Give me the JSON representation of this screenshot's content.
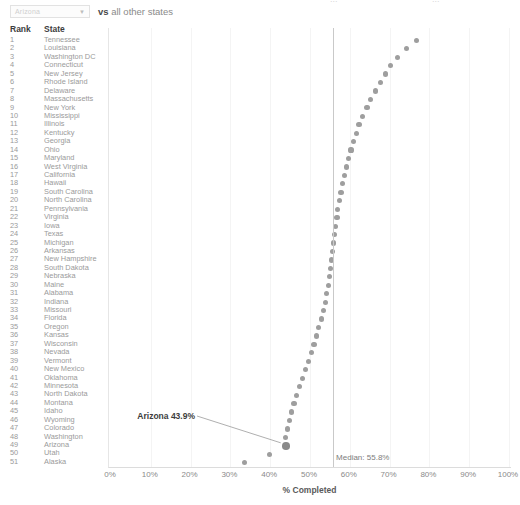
{
  "top_clipped_fragments": [
    "...",
    "..."
  ],
  "controls": {
    "state_select": {
      "value": "Arizona",
      "caret_icon": "chevron-down-icon"
    },
    "vs_prefix": "vs",
    "vs_suffix": "all other states"
  },
  "table": {
    "headers": {
      "rank": "Rank",
      "state": "State"
    }
  },
  "annotation": {
    "label": "Arizona 43.9%"
  },
  "median": {
    "label": "Median: 55.8%",
    "value": 55.8
  },
  "colors": {
    "dot": "#9e9e9e",
    "dot_highlight": "#8a8a8a",
    "median_line": "#c9c9c9",
    "gridline": "#f4f4f4",
    "text": "#9a9a9a",
    "header_text": "#3d3d3d"
  },
  "chart_data": {
    "type": "scatter",
    "title": "",
    "xlabel": "% Completed",
    "ylabel": "",
    "xlim": [
      0,
      100
    ],
    "xticks": [
      0,
      10,
      20,
      30,
      40,
      50,
      60,
      70,
      80,
      90,
      100
    ],
    "xticklabels": [
      "0%",
      "10%",
      "20%",
      "30%",
      "40%",
      "50%",
      "60%",
      "70%",
      "80%",
      "90%",
      "100%"
    ],
    "grid": true,
    "legend": null,
    "median": 55.8,
    "median_label": "Median: 55.8%",
    "highlight": "Arizona",
    "highlight_label": "Arizona 43.9%",
    "categories": [
      "Tennessee",
      "Louisiana",
      "Washington DC",
      "Connecticut",
      "New Jersey",
      "Rhode Island",
      "Delaware",
      "Massachusetts",
      "New York",
      "Mississippi",
      "Illinois",
      "Kentucky",
      "Georgia",
      "Ohio",
      "Maryland",
      "West Virginia",
      "California",
      "Hawaii",
      "South Carolina",
      "North Carolina",
      "Pennsylvania",
      "Virginia",
      "Iowa",
      "Texas",
      "Michigan",
      "Arkansas",
      "New Hampshire",
      "South Dakota",
      "Nebraska",
      "Maine",
      "Alabama",
      "Indiana",
      "Missouri",
      "Florida",
      "Oregon",
      "Kansas",
      "Wisconsin",
      "Nevada",
      "Vermont",
      "New Mexico",
      "Oklahoma",
      "Minnesota",
      "North Dakota",
      "Montana",
      "Idaho",
      "Wyoming",
      "Colorado",
      "Washington",
      "Arizona",
      "Utah",
      "Alaska"
    ],
    "ranks": [
      1,
      2,
      3,
      4,
      5,
      6,
      7,
      8,
      9,
      10,
      11,
      12,
      13,
      14,
      15,
      16,
      17,
      18,
      19,
      20,
      21,
      22,
      23,
      24,
      25,
      26,
      27,
      28,
      29,
      30,
      31,
      32,
      33,
      34,
      35,
      36,
      37,
      38,
      39,
      40,
      41,
      42,
      43,
      44,
      45,
      46,
      47,
      48,
      49,
      50,
      51
    ],
    "values": [
      76.8,
      74.2,
      71.9,
      70.3,
      69.0,
      67.8,
      66.4,
      65.2,
      64.3,
      63.2,
      62.3,
      61.6,
      60.9,
      60.3,
      59.7,
      59.1,
      58.6,
      58.2,
      57.8,
      57.4,
      57.0,
      56.8,
      56.5,
      56.2,
      55.9,
      55.7,
      55.5,
      55.2,
      55.0,
      54.6,
      54.2,
      53.8,
      53.3,
      52.8,
      52.2,
      51.6,
      51.0,
      50.3,
      49.6,
      48.9,
      48.1,
      47.4,
      46.7,
      46.0,
      45.4,
      44.8,
      44.3,
      43.9,
      43.9,
      39.8,
      33.6
    ]
  }
}
